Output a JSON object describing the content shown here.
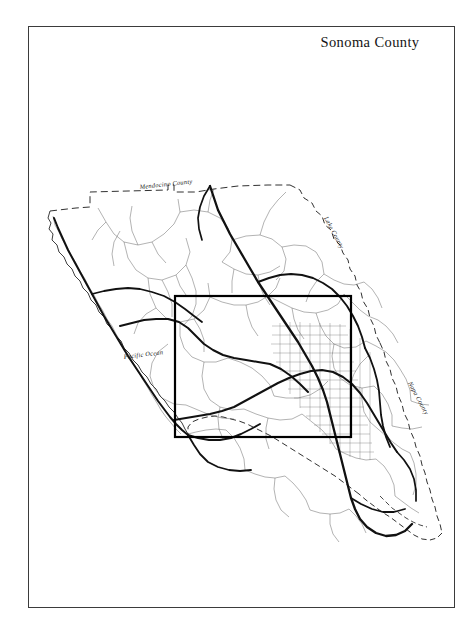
{
  "document": {
    "title": "Sonoma County",
    "frame": {
      "border_color": "#3b3b3b"
    },
    "background_color": "#ffffff",
    "ink_color": "#1a1a1a"
  },
  "map": {
    "subject": "Sonoma County",
    "type": "county base map with highways and study-area inset box",
    "labels": [
      {
        "id": "mendocino",
        "text": "Mendocino County",
        "x": 112,
        "y": 163,
        "rotate": -6
      },
      {
        "id": "pacific",
        "text": "Pacific Ocean",
        "x": 96,
        "y": 333,
        "rotate": -7
      },
      {
        "id": "lake",
        "text": "Lake County",
        "x": 296,
        "y": 192,
        "rotate": 62
      },
      {
        "id": "napa",
        "text": "Napa County",
        "x": 380,
        "y": 357,
        "rotate": 62
      }
    ],
    "features": {
      "county_boundary_solid": "Pacific coastline on the west, drawn as a fine ragged line",
      "county_boundary_dashed": "north, northeast and south county lines drawn dashed",
      "highways_major": "US 101 north-south, SR 12, SR 116, SR 1 along the coast, SR 128",
      "roads_minor": "secondary road network in thin line",
      "urban_grid": "Santa Rosa / Rohnert Park street grid shown as fine crosshatch",
      "inset_box": "bold rectangular study-area outline over the central county"
    },
    "inset_box": {
      "x": 147,
      "y": 270,
      "width": 176,
      "height": 141,
      "stroke_width": 2.2
    },
    "legend_items": []
  }
}
